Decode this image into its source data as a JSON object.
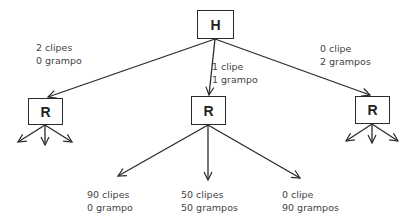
{
  "diagram": {
    "type": "tree",
    "root": {
      "label": "H"
    },
    "children": [
      {
        "label": "R",
        "edge": {
          "line1": "2 clipes",
          "line2": "0 grampo"
        }
      },
      {
        "label": "R",
        "edge": {
          "line1": "1 clipe",
          "line2": "1 grampo"
        }
      },
      {
        "label": "R",
        "edge": {
          "line1": "0 clipe",
          "line2": "2 grampos"
        }
      }
    ],
    "outcomes": [
      {
        "line1": "90 clipes",
        "line2": "0 grampo"
      },
      {
        "line1": "50 clipes",
        "line2": "50 grampos"
      },
      {
        "line1": "0 clipe",
        "line2": "90 grampos"
      }
    ]
  },
  "colors": {
    "stroke": "#2a2a2a",
    "text": "#444444",
    "background": "#ffffff"
  }
}
